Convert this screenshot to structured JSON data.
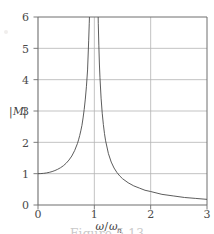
{
  "figure": {
    "caption": "Figure 5.13",
    "background_color": "#ffffff"
  },
  "chart_data": {
    "type": "line",
    "title": "",
    "subtitle": "",
    "xlabel": "ω/ωₙ",
    "ylabel": "|M|",
    "xlabel_numerator": "ω",
    "xlabel_slash": "/",
    "xlabel_denominator": "ω",
    "xlabel_subscript": "n",
    "ylabel_bar_left": "|",
    "ylabel_symbol": "M",
    "ylabel_bar_right": "|",
    "xlim": [
      0,
      3
    ],
    "ylim": [
      0,
      6
    ],
    "xticks": [
      0,
      1,
      2,
      3
    ],
    "xtick_labels": [
      "0",
      "1",
      "2",
      "3"
    ],
    "yticks": [
      0,
      1,
      2,
      3,
      4,
      5,
      6
    ],
    "ytick_labels": [
      "0",
      "1",
      "2",
      "3",
      "4",
      "5",
      "6"
    ],
    "grid": true,
    "grid_color": "#b4b4b4",
    "axis_color": "#6e6e6e",
    "curve_color": "#4a4a4a",
    "curve_width": 0.9,
    "legend": null,
    "legend_position": "none",
    "annotations": [],
    "formula": "|M| = 1 / |1 - (ω/ωₙ)^2|",
    "asymptote_x": 1,
    "series": [
      {
        "name": "|M| low-frequency branch",
        "x": [
          0.0,
          0.05,
          0.1,
          0.15,
          0.2,
          0.25,
          0.3,
          0.35,
          0.4,
          0.45,
          0.5,
          0.55,
          0.6,
          0.65,
          0.7,
          0.72,
          0.74,
          0.76,
          0.78,
          0.8,
          0.82,
          0.84,
          0.86,
          0.88,
          0.9,
          0.91,
          0.92,
          0.93,
          0.94,
          0.95,
          0.955,
          0.96,
          0.965,
          0.97,
          0.972
        ],
        "y": [
          1.0,
          1.003,
          1.01,
          1.023,
          1.042,
          1.067,
          1.099,
          1.14,
          1.19,
          1.252,
          1.333,
          1.435,
          1.563,
          1.736,
          1.961,
          2.08,
          2.215,
          2.367,
          2.542,
          2.778,
          3.05,
          3.38,
          3.79,
          4.31,
          5.26,
          5.8,
          6.4,
          7.1,
          8.0,
          9.2,
          10.0,
          11.0,
          12.2,
          13.8,
          14.9
        ]
      },
      {
        "name": "|M| high-frequency branch",
        "x": [
          1.028,
          1.03,
          1.035,
          1.04,
          1.045,
          1.05,
          1.06,
          1.07,
          1.08,
          1.09,
          1.1,
          1.12,
          1.14,
          1.16,
          1.18,
          1.2,
          1.25,
          1.3,
          1.35,
          1.4,
          1.45,
          1.5,
          1.6,
          1.7,
          1.8,
          1.9,
          2.0,
          2.2,
          2.4,
          2.6,
          2.8,
          3.0
        ],
        "y": [
          15.0,
          14.0,
          12.0,
          10.4,
          9.2,
          8.2,
          6.8,
          5.8,
          5.1,
          4.5,
          4.06,
          3.41,
          2.93,
          2.57,
          2.28,
          2.05,
          1.64,
          1.37,
          1.18,
          1.04,
          0.93,
          0.84,
          0.71,
          0.61,
          0.54,
          0.47,
          0.43,
          0.34,
          0.29,
          0.24,
          0.21,
          0.18
        ]
      }
    ]
  }
}
